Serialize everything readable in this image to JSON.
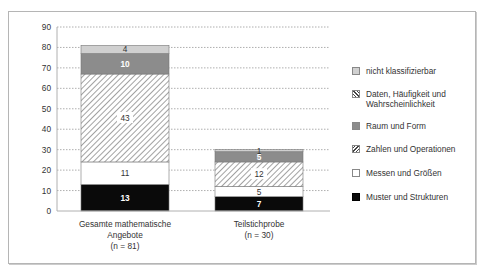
{
  "chart_data": {
    "type": "bar",
    "stacked": true,
    "title": "",
    "xlabel": "",
    "ylabel": "",
    "ylim": [
      0,
      90
    ],
    "yticks": [
      0,
      10,
      20,
      30,
      40,
      50,
      60,
      70,
      80,
      90
    ],
    "grid": true,
    "legend_position": "right",
    "categories": [
      {
        "label_lines": [
          "Gesamte mathematische",
          "Angebote",
          "(n = 81)"
        ]
      },
      {
        "label_lines": [
          "Teilstichprobe",
          "(n = 30)"
        ]
      }
    ],
    "series": [
      {
        "name": "Muster und Strukturen",
        "values": [
          13,
          7
        ],
        "fill": "black",
        "label_color": "#ffffff"
      },
      {
        "name": "Messen und Größen",
        "values": [
          11,
          5
        ],
        "fill": "white",
        "label_color": "#333333"
      },
      {
        "name": "Zahlen und Operationen",
        "values": [
          43,
          12
        ],
        "fill": "hatch-forward",
        "label_color": "#333333"
      },
      {
        "name": "Raum und Form",
        "values": [
          10,
          5
        ],
        "fill": "#8c8c8c",
        "label_color": "#ffffff"
      },
      {
        "name": "Daten, Häufigkeit und Wahrscheinlichkeit",
        "values": [
          0,
          0
        ],
        "fill": "hatch-back",
        "label_color": "#333333"
      },
      {
        "name": "nicht klassifizierbar",
        "values": [
          4,
          1
        ],
        "fill": "#d0d0d0",
        "label_color": "#333333"
      }
    ],
    "legend_order": [
      "nicht klassifizierbar",
      "Daten, Häufigkeit und Wahrscheinlichkeit",
      "Raum und Form",
      "Zahlen und Operationen",
      "Messen und Größen",
      "Muster und Strukturen"
    ]
  },
  "legend": {
    "items": [
      {
        "label_lines": [
          "nicht klassifizierbar"
        ],
        "swatch": "light-grey"
      },
      {
        "label_lines": [
          "Daten, Häufigkeit und",
          "Wahrscheinlichkeit"
        ],
        "swatch": "hatch-back"
      },
      {
        "label_lines": [
          "Raum und Form"
        ],
        "swatch": "dark-grey"
      },
      {
        "label_lines": [
          "Zahlen und Operationen"
        ],
        "swatch": "hatch-forward"
      },
      {
        "label_lines": [
          "Messen und Größen"
        ],
        "swatch": "white"
      },
      {
        "label_lines": [
          "Muster und Strukturen"
        ],
        "swatch": "black"
      }
    ]
  },
  "colors": {
    "black": "#0a0a0a",
    "dark_grey": "#8c8c8c",
    "light_grey": "#d0d0d0",
    "grid": "#9a9a9a",
    "axis": "#b0b0b0",
    "text": "#333333"
  }
}
